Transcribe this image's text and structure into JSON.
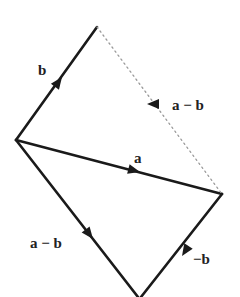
{
  "diagram": {
    "type": "vector-parallelogram",
    "colors": {
      "stroke": "#1a1a1a",
      "dotted": "#9a9a9a",
      "label": "#222222"
    },
    "vectors": [
      {
        "id": "b",
        "label": "b",
        "from": "O",
        "to": "B",
        "style": "solid"
      },
      {
        "id": "a",
        "label": "a",
        "from": "O",
        "to": "A",
        "style": "solid"
      },
      {
        "id": "a-minus-b-dotted",
        "label": "a − b",
        "from": "A",
        "to": "B",
        "style": "dotted",
        "arrow_direction": "toward B"
      },
      {
        "id": "a-minus-b",
        "label": "a − b",
        "from": "O",
        "to": "D",
        "style": "solid"
      },
      {
        "id": "neg-b",
        "label": "−b",
        "from": "A",
        "to": "D",
        "style": "solid"
      }
    ]
  }
}
